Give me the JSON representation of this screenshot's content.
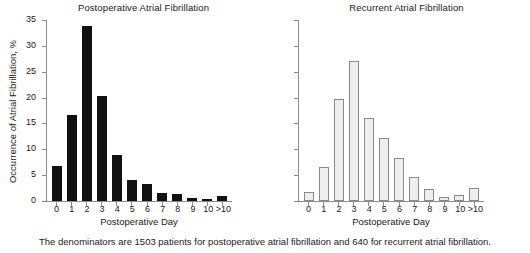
{
  "figure": {
    "caption": "The denominators are 1503 patients for postoperative atrial fibrillation and 640 for recurrent atrial fibrillation."
  },
  "chart_data": [
    {
      "type": "bar",
      "title": "Postoperative Atrial Fibrillation",
      "xlabel": "Postoperative Day",
      "ylabel": "Occurrence of Atrial Fibrillation, %",
      "categories": [
        "0",
        "1",
        "2",
        "3",
        "4",
        "5",
        "6",
        "7",
        "8",
        "9",
        "10",
        ">10"
      ],
      "values": [
        6.7,
        16.6,
        33.8,
        20.4,
        8.9,
        4.1,
        3.2,
        1.5,
        1.3,
        0.6,
        0.4,
        0.9
      ],
      "ylim": [
        0,
        35
      ],
      "yticks": [
        0,
        5,
        10,
        15,
        20,
        25,
        30,
        35
      ],
      "ytick_labels": [
        "0",
        "5",
        "10",
        "15",
        "20",
        "25",
        "30",
        "35"
      ],
      "ytick_labels_visible": true,
      "grid": false,
      "legend": false,
      "bar_style": "solid-black",
      "bar_color": "#111111"
    },
    {
      "type": "bar",
      "title": "Recurrent Atrial Fibrillation",
      "xlabel": "Postoperative Day",
      "ylabel": "",
      "categories": [
        "0",
        "1",
        "2",
        "3",
        "4",
        "5",
        "6",
        "7",
        "8",
        "9",
        "10",
        ">10"
      ],
      "values": [
        1.7,
        6.6,
        19.8,
        27.0,
        16.0,
        12.2,
        8.3,
        4.6,
        2.3,
        0.8,
        1.1,
        2.5
      ],
      "ylim": [
        0,
        35
      ],
      "yticks": [
        0,
        5,
        10,
        15,
        20,
        25,
        30,
        35
      ],
      "ytick_labels": [
        "",
        "",
        "",
        "",
        "",
        "",
        "",
        ""
      ],
      "ytick_labels_visible": false,
      "grid": false,
      "legend": false,
      "bar_style": "hollow-gray",
      "bar_color": "#eeeeee",
      "bar_edge_color": "#8a8a8a"
    }
  ]
}
